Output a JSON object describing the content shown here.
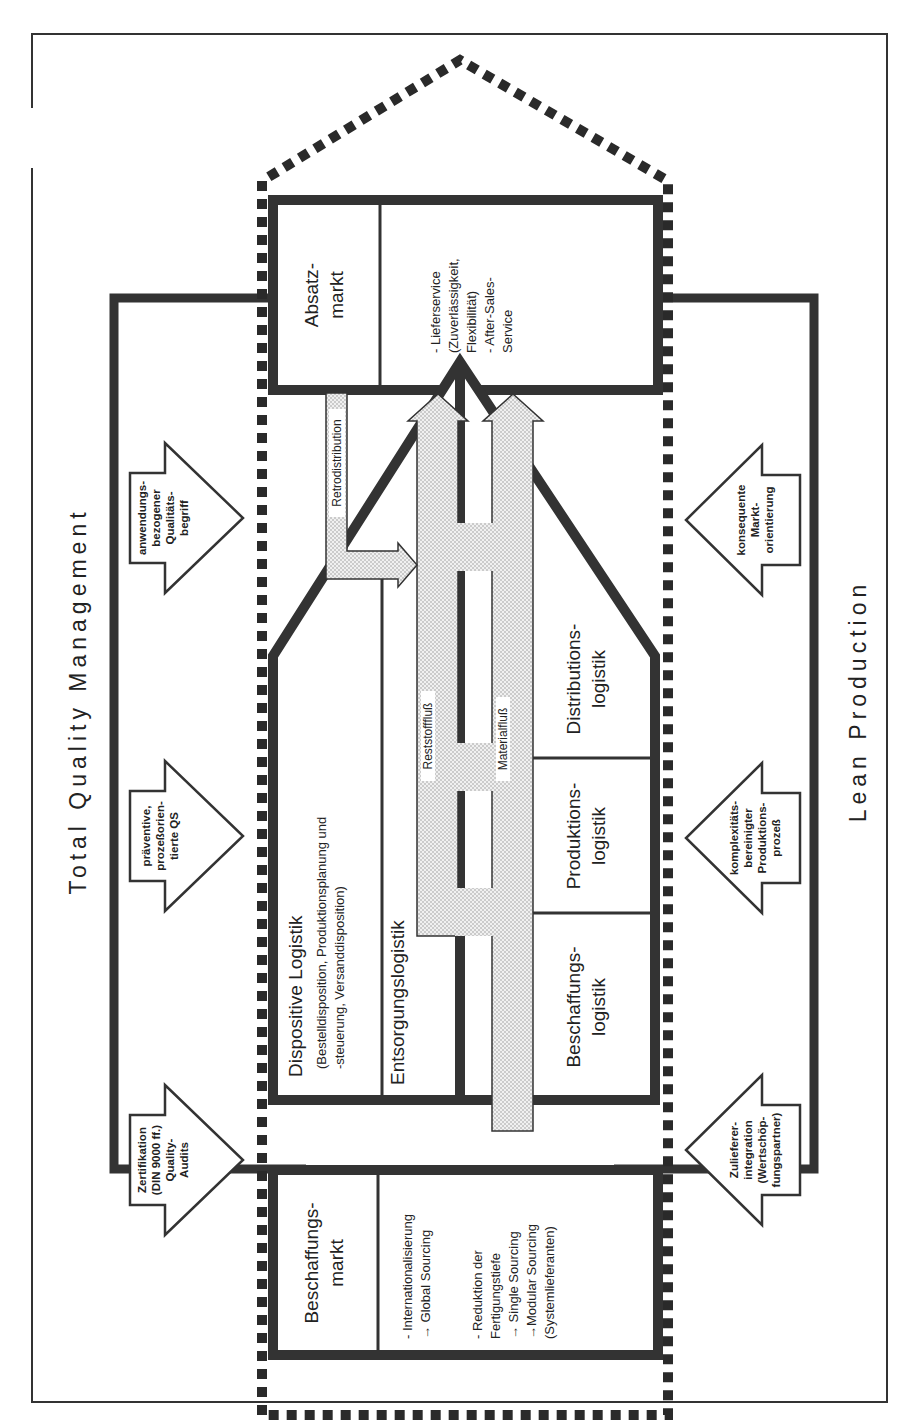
{
  "diagram": {
    "top_label": "Total Quality Management",
    "bottom_label": "Lean Production",
    "markets": {
      "left": {
        "title_lines": [
          "Beschaffungs-",
          "markt"
        ],
        "details": [
          "- Internationalisierung",
          "→ Global Sourcing",
          "",
          "- Reduktion der",
          "  Fertigungstiefe",
          "→ Single Sourcing",
          "→Modular Sourcing",
          "  (Systemlieferanten)"
        ]
      },
      "right": {
        "title_lines": [
          "Absatz-",
          "markt"
        ],
        "details": [
          "- Lieferservice",
          "  (Zuverlässigkeit,",
          "  Flexibilität)",
          "- After-Sales-",
          "  Service"
        ]
      }
    },
    "tqm_arrows": [
      {
        "lines": [
          "Zertifikation",
          "(DIN 9000 ff.)",
          "Quality-",
          "Audits"
        ]
      },
      {
        "lines": [
          "präventive,",
          "prozeßorien-",
          "tierte QS"
        ]
      },
      {
        "lines": [
          "anwendungs-",
          "bezogener",
          "Qualitäts-",
          "begriff"
        ]
      }
    ],
    "lean_arrows": [
      {
        "lines": [
          "Zulieferer-",
          "integration",
          "(Wertschöp-",
          "fungspartner)"
        ]
      },
      {
        "lines": [
          "komplexitäts-",
          "bereinigter",
          "Produktions-",
          "prozeß"
        ]
      },
      {
        "lines": [
          "konsequente",
          "Markt-",
          "orientierung"
        ]
      }
    ],
    "house": {
      "dispositive": {
        "title": "Dispositive Logistik",
        "sub_lines": [
          "(Bestelldisposition, Produktionsplanung und",
          "-steuerung, Versanddisposition)"
        ]
      },
      "entsorgung": "Entsorgungslogistik",
      "flows": {
        "residual": "Reststofffluß",
        "material": "Materialfluß",
        "retro": "Retrodistribution"
      },
      "rooms": [
        {
          "lines": [
            "Beschaffungs-",
            "logistik"
          ]
        },
        {
          "lines": [
            "Produktions-",
            "logistik"
          ]
        },
        {
          "lines": [
            "Distributions-",
            "logistik"
          ]
        }
      ]
    },
    "colors": {
      "ink": "#222222",
      "flow_fill": "#e2e2e2",
      "background": "#ffffff"
    }
  }
}
